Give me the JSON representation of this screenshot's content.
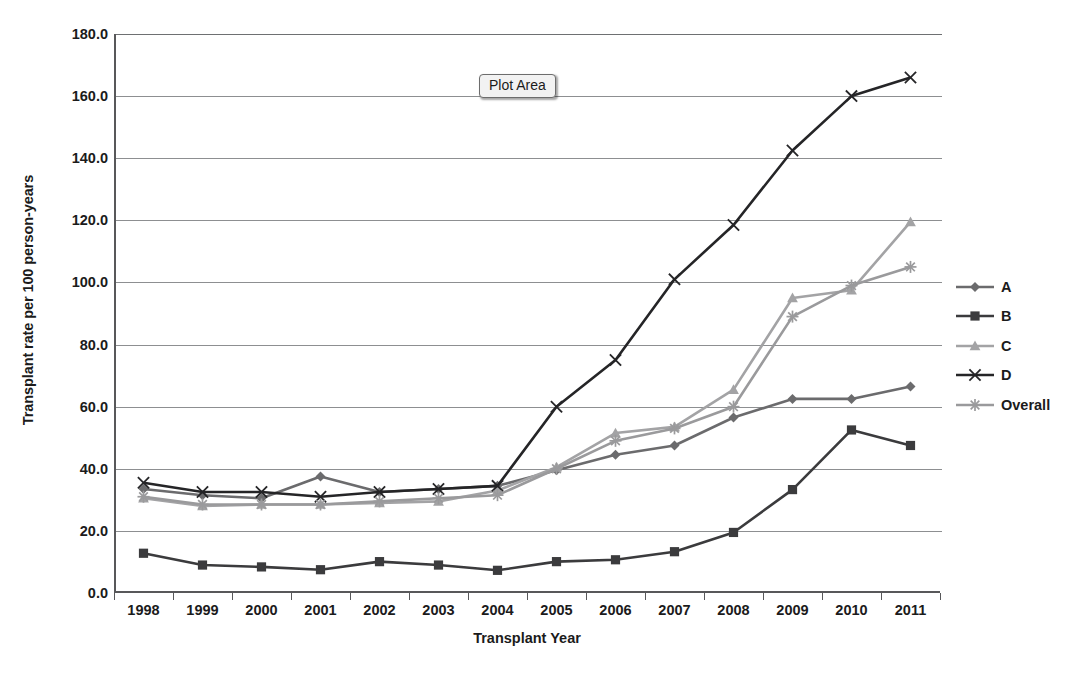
{
  "tooltip": {
    "label": "Plot Area"
  },
  "axes": {
    "y_title": "Transplant rate per 100 person-years",
    "x_title": "Transplant Year",
    "y_ticks": [
      "0.0",
      "20.0",
      "40.0",
      "60.0",
      "80.0",
      "100.0",
      "120.0",
      "140.0",
      "160.0",
      "180.0"
    ]
  },
  "legend": {
    "items": [
      {
        "label": "A",
        "marker": "diamond-marker",
        "color": "#6b6b6d"
      },
      {
        "label": "B",
        "marker": "square-marker",
        "color": "#3b3b3d"
      },
      {
        "label": "C",
        "marker": "triangle-marker",
        "color": "#a3a3a5"
      },
      {
        "label": "D",
        "marker": "cross-marker",
        "color": "#252527"
      },
      {
        "label": "Overall",
        "marker": "asterisk-marker",
        "color": "#9a9a9c"
      }
    ]
  },
  "chart_data": {
    "type": "line",
    "title": "",
    "xlabel": "Transplant Year",
    "ylabel": "Transplant rate per 100 person-years",
    "ylim": [
      0,
      180
    ],
    "ytick_step": 20,
    "grid": true,
    "legend_position": "right",
    "categories": [
      "1998",
      "1999",
      "2000",
      "2001",
      "2002",
      "2003",
      "2004",
      "2005",
      "2006",
      "2007",
      "2008",
      "2009",
      "2010",
      "2011"
    ],
    "series": [
      {
        "name": "A",
        "color": "#6b6b6d",
        "marker": "diamond",
        "values": [
          33.5,
          31.5,
          30.5,
          37.5,
          32.5,
          33.5,
          34.5,
          39.5,
          44.5,
          47.5,
          56.5,
          62.5,
          62.5,
          66.5
        ]
      },
      {
        "name": "B",
        "color": "#3b3b3d",
        "marker": "square",
        "values": [
          12.8,
          9.0,
          8.4,
          7.5,
          10.1,
          9.0,
          7.3,
          10.1,
          10.7,
          13.3,
          19.5,
          33.3,
          52.5,
          47.5
        ]
      },
      {
        "name": "C",
        "color": "#a3a3a5",
        "marker": "triangle",
        "values": [
          30.5,
          28.0,
          28.5,
          28.5,
          29.0,
          29.5,
          33.0,
          40.5,
          51.5,
          53.5,
          65.5,
          95.0,
          97.5,
          119.5
        ]
      },
      {
        "name": "D",
        "color": "#252527",
        "marker": "cross",
        "values": [
          35.5,
          32.5,
          32.5,
          31.0,
          32.5,
          33.5,
          34.5,
          60.0,
          75.0,
          101.0,
          118.5,
          142.5,
          160.0,
          166.0
        ]
      },
      {
        "name": "Overall",
        "color": "#9a9a9c",
        "marker": "asterisk",
        "values": [
          31.0,
          28.5,
          28.5,
          28.5,
          29.5,
          30.5,
          31.5,
          40.0,
          49.0,
          53.0,
          60.0,
          89.0,
          99.0,
          105.0
        ]
      }
    ]
  }
}
